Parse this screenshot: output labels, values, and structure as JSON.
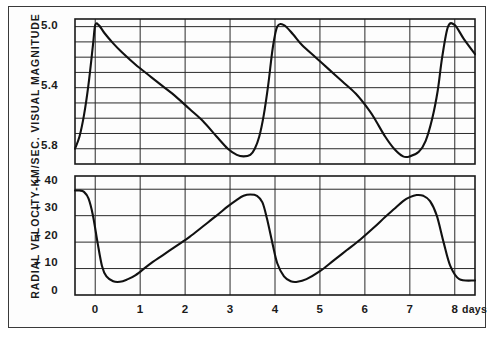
{
  "chart_data": [
    {
      "type": "line",
      "panel": "light-curve",
      "title": "",
      "xlabel": "days",
      "ylabel": "VISUAL MAGNITUDE",
      "xlim": [
        -0.45,
        8.45
      ],
      "ylim": [
        5.9,
        4.95
      ],
      "y_inverted": true,
      "xticks": [
        0,
        1,
        2,
        3,
        4,
        5,
        6,
        7,
        8
      ],
      "xticklabels": [
        "0",
        "1",
        "2",
        "3",
        "4",
        "5",
        "6",
        "7",
        "8"
      ],
      "yticks": [
        5.0,
        5.4,
        5.8
      ],
      "yticklabels": [
        "5.0",
        "5.4",
        "5.8"
      ],
      "y_gridlines": [
        5.0,
        5.1,
        5.2,
        5.3,
        5.4,
        5.5,
        5.6,
        5.7,
        5.8
      ],
      "y_major_gridlines": [
        5.0,
        5.2,
        5.4,
        5.6,
        5.8
      ],
      "grid": true,
      "legend": "none",
      "period_days": 3.7,
      "series": [
        {
          "name": "Visual magnitude",
          "x": [
            -0.45,
            -0.35,
            -0.25,
            -0.15,
            -0.05,
            0.0,
            0.08,
            0.2,
            0.4,
            0.6,
            0.9,
            1.2,
            1.5,
            1.8,
            2.1,
            2.4,
            2.7,
            2.95,
            3.15,
            3.3,
            3.45,
            3.55,
            3.65,
            3.75,
            3.85,
            3.95,
            4.05,
            4.2,
            4.4,
            4.6,
            4.9,
            5.2,
            5.5,
            5.8,
            6.1,
            6.25,
            6.45,
            6.65,
            6.85,
            7.0,
            7.2,
            7.35,
            7.5,
            7.62,
            7.72,
            7.85,
            8.0,
            8.2,
            8.45
          ],
          "y": [
            5.8,
            5.72,
            5.58,
            5.38,
            5.12,
            4.99,
            4.99,
            5.04,
            5.11,
            5.17,
            5.25,
            5.32,
            5.39,
            5.46,
            5.54,
            5.62,
            5.72,
            5.8,
            5.84,
            5.85,
            5.84,
            5.8,
            5.72,
            5.58,
            5.38,
            5.14,
            5.0,
            4.99,
            5.05,
            5.12,
            5.2,
            5.28,
            5.36,
            5.44,
            5.55,
            5.62,
            5.72,
            5.8,
            5.85,
            5.85,
            5.82,
            5.75,
            5.6,
            5.42,
            5.2,
            5.0,
            4.99,
            5.08,
            5.18
          ]
        }
      ]
    },
    {
      "type": "line",
      "panel": "radial-velocity-curve",
      "title": "",
      "xlabel": "days",
      "ylabel": "RADIAL VELOCITY-KM/SEC.",
      "xlim": [
        -0.45,
        8.45
      ],
      "ylim": [
        0,
        45
      ],
      "y_inverted": false,
      "xticks": [
        0,
        1,
        2,
        3,
        4,
        5,
        6,
        7,
        8
      ],
      "xticklabels": [
        "0",
        "1",
        "2",
        "3",
        "4",
        "5",
        "6",
        "7",
        "8"
      ],
      "yticks": [
        0,
        10,
        20,
        30,
        40
      ],
      "yticklabels": [
        "0",
        "+ 10",
        "+ 20",
        "+ 30",
        "+ 40"
      ],
      "y_gridlines": [
        0,
        10,
        20,
        30,
        40
      ],
      "grid": true,
      "legend": "none",
      "period_days": 3.7,
      "series": [
        {
          "name": "Radial velocity",
          "x": [
            -0.45,
            -0.35,
            -0.25,
            -0.15,
            -0.05,
            0.05,
            0.15,
            0.25,
            0.4,
            0.55,
            0.7,
            0.9,
            1.2,
            1.5,
            1.8,
            2.1,
            2.4,
            2.7,
            2.95,
            3.15,
            3.3,
            3.45,
            3.6,
            3.72,
            3.82,
            3.95,
            4.05,
            4.2,
            4.35,
            4.5,
            4.7,
            5.0,
            5.3,
            5.6,
            5.9,
            6.2,
            6.45,
            6.65,
            6.85,
            7.0,
            7.15,
            7.3,
            7.45,
            7.6,
            7.75,
            7.9,
            8.1,
            8.45
          ],
          "y": [
            39.5,
            39.5,
            39.0,
            36.5,
            30.0,
            20.0,
            11.0,
            7.0,
            5.2,
            5.0,
            5.8,
            7.5,
            11.5,
            15.0,
            18.5,
            22.0,
            26.0,
            30.0,
            33.5,
            36.0,
            37.5,
            38.0,
            37.5,
            35.0,
            29.0,
            19.0,
            12.0,
            7.0,
            5.2,
            5.0,
            6.0,
            9.0,
            13.0,
            17.0,
            21.0,
            25.5,
            29.5,
            32.5,
            35.5,
            37.0,
            37.8,
            37.5,
            35.5,
            30.0,
            20.0,
            11.0,
            6.0,
            5.5
          ]
        }
      ]
    }
  ],
  "figure": {
    "axis_title": "RADIAL  VELOCITY-KM/SEC.  VISUAL  MAGNITUDE",
    "x_unit_label": "days",
    "xticklabels": [
      "0",
      "1",
      "2",
      "3",
      "4",
      "5",
      "6",
      "7",
      "8"
    ],
    "top_yticklabels": [
      "5.0",
      "5.4",
      "5.8"
    ],
    "bottom_yticklabels": [
      "+ 40",
      "+ 30",
      "+ 20",
      "+ 10",
      "0"
    ],
    "colors": {
      "curve": "#111111",
      "grid": "#2a2a2a",
      "frame": "#1a1a1a",
      "background": "#fdfdfd",
      "text": "#1b1b1b"
    }
  }
}
